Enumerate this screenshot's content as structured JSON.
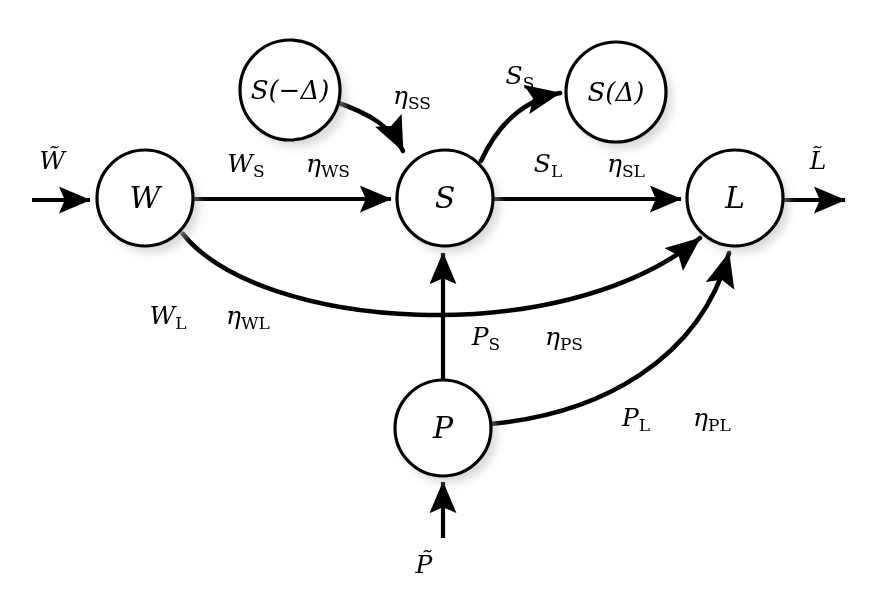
{
  "diagram": {
    "background_color": "#ffffff",
    "stroke_color": "#000000",
    "nodes": [
      {
        "id": "W",
        "label": "W",
        "cx": 145,
        "cy": 198,
        "r": 48
      },
      {
        "id": "S",
        "label": "S",
        "cx": 445,
        "cy": 198,
        "r": 48
      },
      {
        "id": "L",
        "label": "L",
        "cx": 735,
        "cy": 198,
        "r": 48
      },
      {
        "id": "P",
        "label": "P",
        "cx": 443,
        "cy": 428,
        "r": 48
      },
      {
        "id": "S_minus",
        "label": "S(−Δ)",
        "cx": 290,
        "cy": 90,
        "r": 50
      },
      {
        "id": "S_plus",
        "label": "S(Δ)",
        "cx": 616,
        "cy": 92,
        "r": 50
      }
    ],
    "io_labels": {
      "w_in": "W̃",
      "l_out": "L̃",
      "p_in": "P̃"
    },
    "edge_labels": {
      "ws": {
        "flux": "W",
        "flux_sub": "S",
        "eta": "η",
        "eta_sub": "WS"
      },
      "wl": {
        "flux": "W",
        "flux_sub": "L",
        "eta": "η",
        "eta_sub": "WL"
      },
      "sl": {
        "flux": "S",
        "flux_sub": "L",
        "eta": "η",
        "eta_sub": "SL"
      },
      "ss": {
        "flux": "",
        "flux_sub": "",
        "eta": "η",
        "eta_sub": "SS"
      },
      "s_s": {
        "flux": "S",
        "flux_sub": "S",
        "eta": "",
        "eta_sub": ""
      },
      "ps": {
        "flux": "P",
        "flux_sub": "S",
        "eta": "η",
        "eta_sub": "PS"
      },
      "pl": {
        "flux": "P",
        "flux_sub": "L",
        "eta": "η",
        "eta_sub": "PL"
      }
    }
  }
}
